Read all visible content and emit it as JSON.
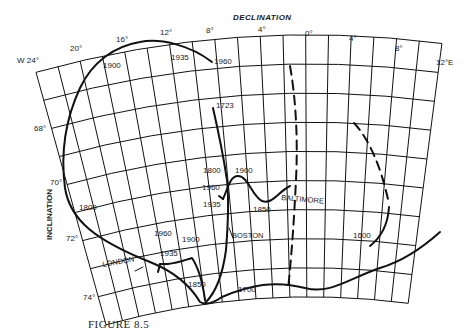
{
  "figure": {
    "title": "DECLINATION",
    "y_axis_title": "INCLINATION",
    "caption": "FIGURE 8.5",
    "declination_ticks": [
      {
        "label": "W 24°",
        "deg": -24
      },
      {
        "label": "20°",
        "deg": -20
      },
      {
        "label": "16°",
        "deg": -16
      },
      {
        "label": "12°",
        "deg": -12
      },
      {
        "label": "8°",
        "deg": -8
      },
      {
        "label": "4°",
        "deg": -4
      },
      {
        "label": "0°",
        "deg": 0
      },
      {
        "label": "4°",
        "deg": 4
      },
      {
        "label": "8°",
        "deg": 8
      },
      {
        "label": "12°E",
        "deg": 12
      }
    ],
    "inclination_ticks": [
      {
        "label": "68°",
        "deg": 68
      },
      {
        "label": "70°",
        "deg": 70
      },
      {
        "label": "72°",
        "deg": 72
      },
      {
        "label": "74°",
        "deg": 74
      }
    ],
    "stations": [
      {
        "name": "LONDON",
        "style": "solid",
        "year_labels": [
          "1600",
          "1700",
          "1800",
          "1850",
          "1900",
          "1935",
          "1960"
        ]
      },
      {
        "name": "BOSTON",
        "style": "solid",
        "year_labels": [
          "1723",
          "1800",
          "1900",
          "1935",
          "1960"
        ]
      },
      {
        "name": "BALTIMORE",
        "style": "solid",
        "year_labels": [
          "1850",
          "1900"
        ]
      }
    ],
    "year_labels": {
      "london_1900_top": "1900",
      "london_1935_top": "1935",
      "london_1960_top": "1960",
      "boston_1723": "1723",
      "boston_1800": "1800",
      "boston_1900": "1900",
      "boston_1960": "1960",
      "boston_1935": "1935",
      "balt_1850": "1850",
      "london_1800": "1800",
      "london_1960_b": "1960",
      "london_1900_b": "1900",
      "london_1935_b": "1935",
      "london_1850": "1850",
      "london_1700": "1700",
      "london_1600": "1600"
    },
    "place_labels": {
      "london": "LONDON",
      "boston": "BOSTON",
      "baltimore": "BALTIMORE"
    }
  }
}
